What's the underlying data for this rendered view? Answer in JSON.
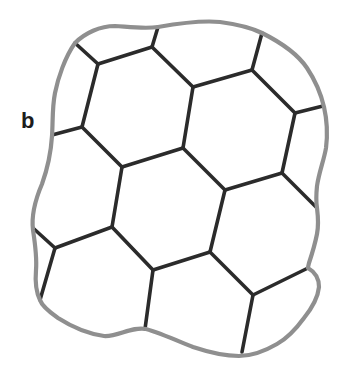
{
  "figure": {
    "type": "cellular-grain-network-diagram",
    "label": "b",
    "colors": {
      "background": "#ffffff",
      "boundary": "#8f8f8f",
      "network": "#2b2b2b",
      "label": "#1c1c1c"
    },
    "boundary": {
      "stroke_width": 4.2,
      "path": "M75 43 C85 33 100 26 115 26 C130 27 145 29 158 27 C175 24 200 20 220 22 C235 24 250 27 262 33 C280 42 297 53 307 68 C315 80 321 94 324 107 C327 120 328 132 326 148 C324 160 319 172 317 186 C316 196 316 202 317 208 C318 216 319 224 317 234 C315 244 312 254 309 263 C308.5 265 308 266.5 308 268 C315 272 319 279 319 287 C318 297 312 308 304 318 C296 329 286 339 277 344 C265 351 252 356 239 356 C224 356 208 352 193 347 C178 341 160 333 146 329 C132 326 118 337 104 336 C90 334 72 327 58 318 C48 311 42 306 40 300 C36 292 35 282 36 270 C37 258 35 243 33 230 C31 214 36 198 42 184 C47 170 51 152 52 136 C53 122 52 108 55 93 C58 78 65 57 75 43 Z"
    },
    "network": {
      "stroke_width": 3.6,
      "vertices": {
        "bTL": [
          75,
          43
        ],
        "n1": [
          98,
          64
        ],
        "n2": [
          152,
          47
        ],
        "bT1": [
          158,
          27
        ],
        "n3": [
          193,
          87
        ],
        "n4": [
          252,
          70
        ],
        "bT2": [
          262,
          33
        ],
        "n5": [
          295,
          113
        ],
        "bR1": [
          323,
          106
        ],
        "n6": [
          282,
          173
        ],
        "bR2": [
          317,
          208
        ],
        "n7": [
          82,
          127
        ],
        "bL1": [
          52,
          135
        ],
        "h1": [
          122,
          167
        ],
        "h2": [
          183,
          148
        ],
        "h3": [
          225,
          190
        ],
        "h4": [
          210,
          252
        ],
        "h5": [
          153,
          270
        ],
        "h6": [
          112,
          227
        ],
        "n8": [
          55,
          248
        ],
        "bL2": [
          33,
          228
        ],
        "bB1": [
          40,
          300
        ],
        "bB2": [
          145,
          329
        ],
        "n9": [
          253,
          295
        ],
        "bB3": [
          242,
          352
        ],
        "bR3": [
          308,
          268
        ]
      },
      "edges": [
        [
          "bTL",
          "n1"
        ],
        [
          "n1",
          "n2"
        ],
        [
          "n2",
          "bT1"
        ],
        [
          "n2",
          "n3"
        ],
        [
          "n3",
          "n4"
        ],
        [
          "n4",
          "bT2"
        ],
        [
          "n4",
          "n5"
        ],
        [
          "n5",
          "bR1"
        ],
        [
          "n5",
          "n6"
        ],
        [
          "n6",
          "bR2"
        ],
        [
          "n6",
          "h3"
        ],
        [
          "n1",
          "n7"
        ],
        [
          "n7",
          "bL1"
        ],
        [
          "n7",
          "h1"
        ],
        [
          "h1",
          "h2"
        ],
        [
          "h2",
          "n3"
        ],
        [
          "h2",
          "h3"
        ],
        [
          "h3",
          "h4"
        ],
        [
          "h4",
          "h5"
        ],
        [
          "h5",
          "h6"
        ],
        [
          "h6",
          "h1"
        ],
        [
          "h6",
          "n8"
        ],
        [
          "n8",
          "bL2"
        ],
        [
          "n8",
          "bB1"
        ],
        [
          "h5",
          "bB2"
        ],
        [
          "h4",
          "n9"
        ],
        [
          "n9",
          "bB3"
        ],
        [
          "n9",
          "bR3"
        ]
      ]
    }
  }
}
